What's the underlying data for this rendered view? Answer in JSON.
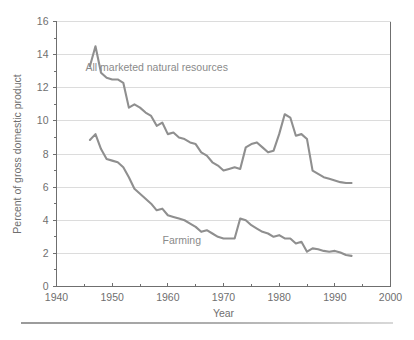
{
  "chart_data": {
    "type": "line",
    "title": "",
    "xlabel": "Year",
    "ylabel": "Percent of gross domestic product",
    "xlim": [
      1940,
      2000
    ],
    "ylim": [
      0,
      16
    ],
    "grid": "horizontal-major",
    "legend_position": "inline-annotations",
    "x_ticks_major": [
      1940,
      1950,
      1960,
      1970,
      1980,
      1990,
      2000
    ],
    "x_ticks_minor": [
      1945,
      1955,
      1965,
      1975,
      1985,
      1995
    ],
    "y_ticks_major": [
      0,
      2,
      4,
      6,
      8,
      10,
      12,
      14,
      16
    ],
    "y_ticks_minor": [
      1,
      3,
      5,
      7,
      9,
      11,
      13,
      15
    ],
    "series": [
      {
        "name": "All marketed natural resources",
        "label_position": "above-upper-curve",
        "color": "#8f8f8f",
        "x": [
          1946,
          1947,
          1948,
          1949,
          1950,
          1951,
          1952,
          1953,
          1954,
          1955,
          1956,
          1957,
          1958,
          1959,
          1960,
          1961,
          1962,
          1963,
          1964,
          1965,
          1966,
          1967,
          1968,
          1969,
          1970,
          1971,
          1972,
          1973,
          1974,
          1975,
          1976,
          1977,
          1978,
          1979,
          1980,
          1981,
          1982,
          1983,
          1984,
          1985,
          1986,
          1987,
          1988,
          1989,
          1990,
          1991,
          1992,
          1993
        ],
        "values": [
          13.3,
          14.5,
          12.9,
          12.6,
          12.5,
          12.5,
          12.3,
          10.8,
          11.0,
          10.8,
          10.5,
          10.3,
          9.7,
          9.9,
          9.2,
          9.3,
          9.0,
          8.9,
          8.7,
          8.6,
          8.1,
          7.9,
          7.5,
          7.3,
          7.0,
          7.1,
          7.2,
          7.1,
          8.4,
          8.6,
          8.7,
          8.4,
          8.1,
          8.2,
          9.2,
          10.4,
          10.2,
          9.1,
          9.2,
          8.9,
          7.0,
          6.8,
          6.6,
          6.5,
          6.4,
          6.3,
          6.25,
          6.25
        ]
      },
      {
        "name": "Farming",
        "label_position": "below-lower-curve",
        "color": "#8f8f8f",
        "x": [
          1946,
          1947,
          1948,
          1949,
          1950,
          1951,
          1952,
          1953,
          1954,
          1955,
          1956,
          1957,
          1958,
          1959,
          1960,
          1961,
          1962,
          1963,
          1964,
          1965,
          1966,
          1967,
          1968,
          1969,
          1970,
          1971,
          1972,
          1973,
          1974,
          1975,
          1976,
          1977,
          1978,
          1979,
          1980,
          1981,
          1982,
          1983,
          1984,
          1985,
          1986,
          1987,
          1988,
          1989,
          1990,
          1991,
          1992,
          1993
        ],
        "values": [
          8.85,
          9.2,
          8.3,
          7.7,
          7.6,
          7.5,
          7.2,
          6.6,
          5.9,
          5.6,
          5.3,
          5.0,
          4.6,
          4.7,
          4.3,
          4.2,
          4.1,
          4.0,
          3.8,
          3.6,
          3.3,
          3.4,
          3.2,
          3.0,
          2.9,
          2.9,
          2.9,
          4.1,
          4.0,
          3.7,
          3.5,
          3.3,
          3.2,
          3.0,
          3.1,
          2.9,
          2.9,
          2.6,
          2.7,
          2.1,
          2.3,
          2.25,
          2.15,
          2.1,
          2.15,
          2.05,
          1.9,
          1.85
        ]
      }
    ],
    "annotations": [
      {
        "text": "All marketed natural resources",
        "x": 1958.0,
        "y": 13.0
      },
      {
        "text": "Farming",
        "x": 1962.5,
        "y": 2.55
      }
    ]
  },
  "axis": {
    "y_label": "Percent of gross domestic product",
    "x_label": "Year",
    "y_tick_labels": [
      "16",
      "14",
      "12",
      "10",
      "8",
      "6",
      "4",
      "2",
      "0"
    ],
    "x_tick_labels": [
      "1940",
      "1950",
      "1960",
      "1970",
      "1980",
      "1990",
      "2000"
    ]
  },
  "colors": {
    "series_line": "#8f8f8f",
    "gridline": "#dcdcdc",
    "frame": "#6f6f6f",
    "text": "#6f6f6f",
    "annotation_text": "#8a8a8a",
    "rule": "#9a9a9a"
  }
}
